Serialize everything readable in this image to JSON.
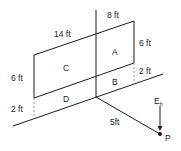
{
  "diagram": {
    "labels": {
      "top_width": "8 ft",
      "top_left_width": "14 ft",
      "right_height": "6 ft",
      "left_height": "6 ft",
      "right_gap": "2 ft",
      "left_gap": "2 ft",
      "distance": "5ft",
      "region_a": "A",
      "region_b": "B",
      "region_c": "C",
      "region_d": "D",
      "field_label": "E",
      "field_sub": "h",
      "point_label": "P"
    },
    "colors": {
      "line": "#1a1a1a",
      "dash": "#999999",
      "background": "#ffffff"
    }
  }
}
